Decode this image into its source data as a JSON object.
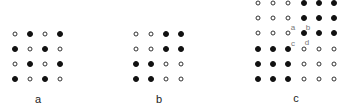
{
  "panels": [
    {
      "id": "a",
      "caption": "a",
      "caption_pos": [
        38,
        99
      ],
      "origin": [
        15,
        34
      ],
      "spacing": 15,
      "grid": [
        [
          0,
          1,
          0,
          1
        ],
        [
          1,
          0,
          1,
          0
        ],
        [
          0,
          1,
          0,
          1
        ],
        [
          1,
          0,
          1,
          0
        ]
      ]
    },
    {
      "id": "b",
      "caption": "b",
      "caption_pos": [
        159,
        99
      ],
      "origin": [
        136,
        34
      ],
      "spacing": 15,
      "grid": [
        [
          0,
          0,
          1,
          1
        ],
        [
          0,
          0,
          1,
          1
        ],
        [
          1,
          1,
          0,
          0
        ],
        [
          1,
          1,
          0,
          0
        ]
      ]
    },
    {
      "id": "c",
      "caption": "c",
      "caption_pos": [
        296,
        98
      ],
      "origin": [
        258,
        3
      ],
      "spacing": 15.2,
      "grid": [
        [
          0,
          0,
          0,
          1,
          1,
          1
        ],
        [
          0,
          0,
          0,
          1,
          1,
          1
        ],
        [
          0,
          0,
          0,
          1,
          1,
          1
        ],
        [
          1,
          1,
          1,
          0,
          0,
          0
        ],
        [
          1,
          1,
          1,
          0,
          0,
          0
        ],
        [
          1,
          1,
          1,
          0,
          0,
          0
        ]
      ],
      "point_labels": [
        {
          "text": "a",
          "pos": [
            293,
            27
          ]
        },
        {
          "text": "b",
          "pos": [
            308,
            27
          ]
        },
        {
          "text": "c",
          "pos": [
            293,
            43
          ]
        },
        {
          "text": "d",
          "pos": [
            307,
            42
          ]
        }
      ]
    }
  ],
  "legend": {
    "filled": "filled-dot",
    "open": "open-dot"
  }
}
